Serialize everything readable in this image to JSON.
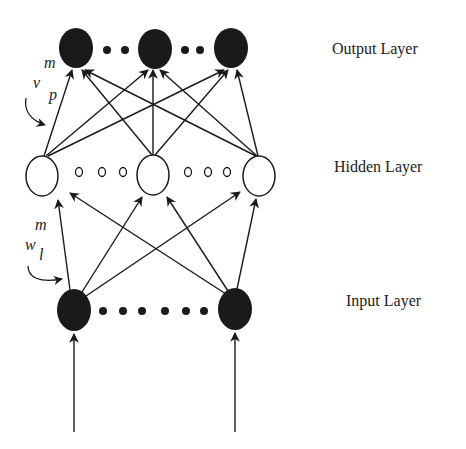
{
  "diagram": {
    "type": "neural-network",
    "colors": {
      "ink": "#1a1a1a",
      "text": "#222222",
      "background": "#ffffff"
    },
    "layers": [
      {
        "name": "output",
        "label": "Output Layer",
        "node_style": "filled",
        "visible_nodes": 3,
        "ellipsis": [
          "dots",
          "dots"
        ]
      },
      {
        "name": "hidden",
        "label": "Hidden Layer",
        "node_style": "hollow",
        "visible_nodes": 3,
        "ellipsis": [
          "small-circles",
          "small-circles"
        ]
      },
      {
        "name": "input",
        "label": "Input Layer",
        "node_style": "filled",
        "visible_nodes": 2,
        "ellipsis": [
          "dots"
        ]
      }
    ],
    "weights": {
      "hidden_to_output": {
        "symbol": "v",
        "superscript": "m",
        "subscript": "p"
      },
      "input_to_hidden": {
        "symbol": "w",
        "superscript": "m",
        "subscript": "l"
      }
    }
  },
  "labels": {
    "output": "Output Layer",
    "hidden": "Hidden Layer",
    "input": "Input Layer"
  },
  "math": {
    "v_sym": "v",
    "v_sup": "m",
    "v_sub": "p",
    "w_sym": "w",
    "w_sup": "m",
    "w_sub": "l"
  }
}
